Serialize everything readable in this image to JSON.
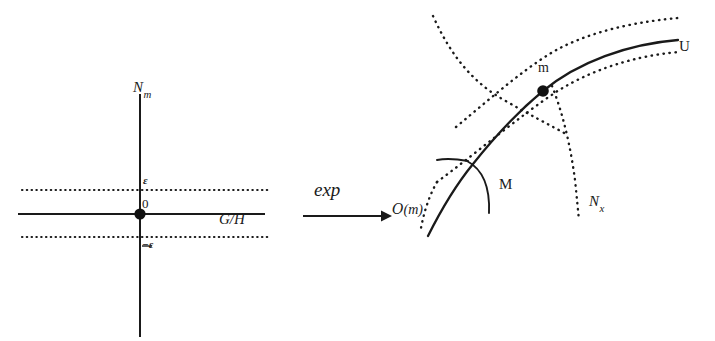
{
  "figure": {
    "background_color": "#ffffff",
    "ink_color": "#1a1a1a",
    "width": 715,
    "height": 341
  },
  "left_panel": {
    "name": "tangent-space-diagram",
    "vertical_axis_label": "N",
    "vertical_axis_subscript": "m",
    "horizontal_axis_label": "G/H",
    "origin_label": "0",
    "upper_band_label": "ε",
    "lower_band_label": "−ε",
    "origin_point": {
      "x": 140,
      "y": 214
    },
    "vertical_axis": {
      "x": 140,
      "y_top": 94,
      "y_bottom": 337
    },
    "horizontal_axis": {
      "y": 214,
      "x_left": 18,
      "x_right": 265
    },
    "upper_dotted_line": {
      "y": 190,
      "x_left": 22,
      "x_right": 268
    },
    "lower_dotted_line": {
      "y": 237,
      "x_left": 22,
      "x_right": 268
    }
  },
  "map_arrow": {
    "name": "exp-map-arrow",
    "label": "exp",
    "arrow_from_x": 303,
    "arrow_to_x": 388,
    "arrow_y": 216,
    "label_x": 318,
    "label_y": 183
  },
  "right_panel": {
    "name": "manifold-diagram",
    "point_label": "m",
    "neighborhood_label": "U",
    "slice_label": "M",
    "orbit_label": "ᵒ(m)",
    "orbit_label_script": "O",
    "orbit_label_rest": "(m)",
    "transversal_label": "N",
    "transversal_subscript": "x",
    "point_m": {
      "x": 543,
      "y": 91
    },
    "labels": {
      "m": {
        "x": 536,
        "y": 66
      },
      "U": {
        "x": 678,
        "y": 42
      },
      "M": {
        "x": 497,
        "y": 173
      },
      "orbit": {
        "x": 394,
        "y": 202
      },
      "N_x": {
        "x": 588,
        "y": 192
      }
    }
  },
  "geometry": {
    "main_curve_path": "M 437 233 C 470 196 500 142 543 91 C 580 50 630 37 680 35",
    "upper_dotted_path": "M 456 127 C 498 92 530 64 560 48 C 600 28 645 21 678 18",
    "lower_dotted_path": "M 437 182 C 480 150 520 116 556 92 C 600 64 650 54 680 52",
    "left_dotted_path": "M 433 16 C 450 55 470 80 500 97 C 525 112 545 122 562 131",
    "right_dotted_path": "M 556 92 C 566 118 572 150 576 180 C 578 198 579 210 580 219",
    "orbit_curve_path": "M 432 233 C 441 210 452 188 466 168",
    "m_slice_tick_path": "M 438 163 C 447 161 456 161 466 163",
    "m_arc_path": "M 466 163 C 483 170 489 188 488 212"
  }
}
